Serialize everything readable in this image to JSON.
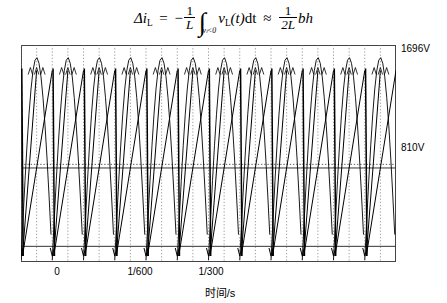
{
  "formula": {
    "lhs_delta": "Δ",
    "lhs_i": "i",
    "lhs_sub": "L",
    "equals": "=",
    "minus": "−",
    "frac1_num": "1",
    "frac1_den": "L",
    "integral_glyph": "∫",
    "integral_limit": "vₗ<0",
    "integrand_v": "v",
    "integrand_sub": "L",
    "integrand_arg": "(t)",
    "differential": "dt",
    "approx": "≈",
    "frac2_num": "1",
    "frac2_den": "2L",
    "rhs_bh": "bh",
    "plain_text": "Δi_L = −(1/L)∫_{v_L<0} v_L(t)dt ≈ (1/2L)bh"
  },
  "chart_data": {
    "type": "line",
    "title": "",
    "xlabel": "时间/s",
    "ylabel": "",
    "x_tick_labels": [
      "0",
      "1/600",
      "1/300"
    ],
    "x_tick_values": [
      0,
      0.0016667,
      0.0033333
    ],
    "y_annotations": [
      {
        "label": "1696V",
        "value": 1696,
        "position": "top-right"
      },
      {
        "label": "810V",
        "value": 810,
        "position": "mid-right"
      }
    ],
    "ylim": [
      0,
      1800
    ],
    "xlim": [
      0,
      0.0094
    ],
    "grid": true,
    "grid_style": "dotted-vertical",
    "legend": false,
    "series": [
      {
        "name": "rectified-sine-envelope",
        "description": "full-wave rectified mains voltage arches peaking at 1696 V",
        "peak": 1696,
        "cycles": 12,
        "color": "#000000"
      },
      {
        "name": "inductor-ripple-sawtooth",
        "description": "steep triangular inductor current ripple descending from each arch peak toward baseline",
        "color": "#000000",
        "cycles": 12
      }
    ],
    "reference_lines": [
      {
        "value": 810,
        "style": "dotted",
        "label": "810V"
      },
      {
        "value": 780,
        "style": "solid",
        "label": ""
      },
      {
        "value": 130,
        "style": "solid",
        "label": ""
      }
    ]
  }
}
